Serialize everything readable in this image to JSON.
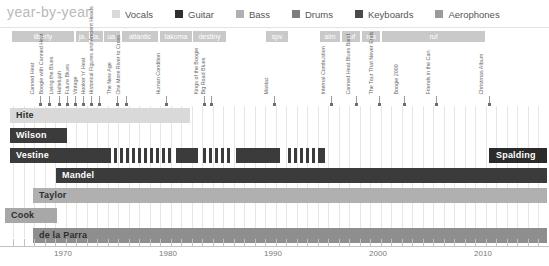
{
  "header": {
    "brand": "year-by-year",
    "legend": [
      {
        "label": "Vocals",
        "color": "#d9d9d9",
        "name": "legend-vocals"
      },
      {
        "label": "Guitar",
        "color": "#2f2f2f",
        "name": "legend-guitar"
      },
      {
        "label": "Bass",
        "color": "#b0b0b0",
        "name": "legend-bass"
      },
      {
        "label": "Drums",
        "color": "#7d7d7d",
        "name": "legend-drums"
      },
      {
        "label": "Keyboards",
        "color": "#4a4a4a",
        "name": "legend-keyboards"
      },
      {
        "label": "Aerophones",
        "color": "#9a9a9a",
        "name": "legend-aerophones"
      }
    ]
  },
  "record_labels": [
    {
      "text": "liberty",
      "x": 12,
      "w": 62
    },
    {
      "text": "ja.",
      "x": 76,
      "w": 13
    },
    {
      "text": "la.",
      "x": 90,
      "w": 13
    },
    {
      "text": "ua.",
      "x": 104,
      "w": 16
    },
    {
      "text": "atlantic",
      "x": 122,
      "w": 36
    },
    {
      "text": "takoma",
      "x": 160,
      "w": 32
    },
    {
      "text": "destiny",
      "x": 193,
      "w": 33
    },
    {
      "text": "spv",
      "x": 266,
      "w": 22
    },
    {
      "text": "aim",
      "x": 320,
      "w": 20
    },
    {
      "text": "ruf",
      "x": 342,
      "w": 18
    },
    {
      "text": "rca",
      "x": 362,
      "w": 18
    },
    {
      "text": "ruf",
      "x": 382,
      "w": 103
    }
  ],
  "albums": [
    {
      "title": "Canned Heat",
      "x": 36
    },
    {
      "title": "Boogie with Canned Heat",
      "x": 45
    },
    {
      "title": "Living the Blues",
      "x": 55
    },
    {
      "title": "Hallelujah",
      "x": 63
    },
    {
      "title": "Future Blues",
      "x": 71
    },
    {
      "title": "Vintage",
      "x": 79
    },
    {
      "title": "Hooker 'n' Heat",
      "x": 87
    },
    {
      "title": "Historical Figures and Ancient Heads",
      "x": 95
    },
    {
      "title": "The New Age",
      "x": 113
    },
    {
      "title": "One More River to Cross",
      "x": 122
    },
    {
      "title": "Human Condition",
      "x": 162
    },
    {
      "title": "Kings of the Boogie",
      "x": 200
    },
    {
      "title": "Big Road Blues",
      "x": 207
    },
    {
      "title": "Mastaz",
      "x": 270
    },
    {
      "title": "Internal Combustion",
      "x": 327
    },
    {
      "title": "Canned Heat Blues Band",
      "x": 352
    },
    {
      "title": "The Tour That Never Ends",
      "x": 375
    },
    {
      "title": "Boogie 2000",
      "x": 400
    },
    {
      "title": "Friends in the Can",
      "x": 432
    },
    {
      "title": "Christmas Album",
      "x": 485
    }
  ],
  "members": [
    {
      "name": "Hite",
      "label_style": "light",
      "y": 2,
      "segments": [
        {
          "x": 10,
          "w": 180,
          "color": "#d9d9d9"
        }
      ]
    },
    {
      "name": "Wilson",
      "label_style": "dark",
      "y": 22,
      "segments": [
        {
          "x": 10,
          "w": 57,
          "color": "#3b3b3b"
        }
      ]
    },
    {
      "name": "Vestine",
      "label_style": "dark",
      "y": 42,
      "segments": [
        {
          "x": 10,
          "w": 101,
          "color": "#3b3b3b"
        },
        {
          "x": 114,
          "w": 3,
          "color": "#3b3b3b"
        },
        {
          "x": 120,
          "w": 3,
          "color": "#3b3b3b"
        },
        {
          "x": 126,
          "w": 3,
          "color": "#3b3b3b"
        },
        {
          "x": 132,
          "w": 3,
          "color": "#3b3b3b"
        },
        {
          "x": 138,
          "w": 3,
          "color": "#3b3b3b"
        },
        {
          "x": 144,
          "w": 3,
          "color": "#3b3b3b"
        },
        {
          "x": 150,
          "w": 3,
          "color": "#3b3b3b"
        },
        {
          "x": 156,
          "w": 3,
          "color": "#3b3b3b"
        },
        {
          "x": 162,
          "w": 3,
          "color": "#3b3b3b"
        },
        {
          "x": 168,
          "w": 3,
          "color": "#3b3b3b"
        },
        {
          "x": 176,
          "w": 22,
          "color": "#3b3b3b"
        },
        {
          "x": 203,
          "w": 3,
          "color": "#3b3b3b"
        },
        {
          "x": 209,
          "w": 3,
          "color": "#3b3b3b"
        },
        {
          "x": 215,
          "w": 3,
          "color": "#3b3b3b"
        },
        {
          "x": 221,
          "w": 3,
          "color": "#3b3b3b"
        },
        {
          "x": 227,
          "w": 3,
          "color": "#3b3b3b"
        },
        {
          "x": 236,
          "w": 44,
          "color": "#3b3b3b"
        },
        {
          "x": 288,
          "w": 3,
          "color": "#3b3b3b"
        },
        {
          "x": 294,
          "w": 3,
          "color": "#3b3b3b"
        },
        {
          "x": 300,
          "w": 3,
          "color": "#3b3b3b"
        },
        {
          "x": 306,
          "w": 3,
          "color": "#3b3b3b"
        },
        {
          "x": 312,
          "w": 3,
          "color": "#3b3b3b"
        },
        {
          "x": 318,
          "w": 7,
          "color": "#3b3b3b"
        },
        {
          "x": 489,
          "w": 58,
          "color": "#2b2b2b"
        }
      ],
      "extra_label": {
        "text": "Spalding",
        "x": 489,
        "style": "dark"
      }
    },
    {
      "name": "Mandel",
      "label_style": "dark",
      "y": 62,
      "segments": [
        {
          "x": 56,
          "w": 491,
          "color": "#3b3b3b"
        }
      ]
    },
    {
      "name": "Taylor",
      "label_style": "light",
      "y": 82,
      "segments": [
        {
          "x": 33,
          "w": 514,
          "color": "#b0b0b0"
        }
      ]
    },
    {
      "name": "Cook",
      "label_style": "light",
      "y": 102,
      "segments": [
        {
          "x": 5,
          "w": 52,
          "color": "#a8a8a8"
        }
      ]
    },
    {
      "name": "de la Parra",
      "label_style": "light",
      "y": 122,
      "segments": [
        {
          "x": 33,
          "w": 514,
          "color": "#8e8e8e"
        }
      ]
    }
  ],
  "axis": {
    "year_labels": [
      "1970",
      "1980",
      "1990",
      "2000",
      "2010"
    ],
    "year_x": [
      63,
      168,
      273,
      378,
      483
    ],
    "tick_start_x": 13,
    "tick_spacing": 10.5,
    "tick_count": 52
  },
  "chart_data": {
    "type": "bar",
    "title": "year-by-year",
    "xlabel": "",
    "ylabel": "",
    "xlim": [
      1965,
      2015
    ],
    "categories": [
      "Hite",
      "Wilson",
      "Vestine",
      "Mandel",
      "Taylor",
      "Cook",
      "de la Parra",
      "Spalding"
    ],
    "series": [
      {
        "name": "Hite",
        "role": "Vocals",
        "start": 1965,
        "end": 1981
      },
      {
        "name": "Wilson",
        "role": "Guitar",
        "start": 1965,
        "end": 1970
      },
      {
        "name": "Vestine",
        "role": "Guitar",
        "start": 1965,
        "end": 1995
      },
      {
        "name": "Mandel",
        "role": "Guitar",
        "start": 1969,
        "end": 2015
      },
      {
        "name": "Taylor",
        "role": "Bass",
        "start": 1967,
        "end": 2015
      },
      {
        "name": "Cook",
        "role": "Bass",
        "start": 1964,
        "end": 1969
      },
      {
        "name": "de la Parra",
        "role": "Drums",
        "start": 1967,
        "end": 2015
      },
      {
        "name": "Spalding",
        "role": "Guitar",
        "start": 2010,
        "end": 2015
      }
    ],
    "grid": true,
    "legend_position": "top"
  }
}
